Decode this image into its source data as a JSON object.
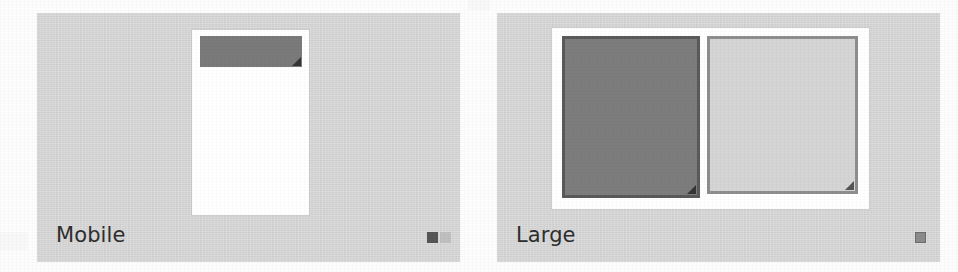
{
  "page": {
    "background_color": "#fdfdfd"
  },
  "colors": {
    "panel_background": "#d6d6d6",
    "card_background": "#ffffff",
    "block_dark": "#7a7a7a",
    "block_dark_border": "#5a5a5a",
    "block_light": "#d5d5d5",
    "block_light_border": "#8e8e8e",
    "label_text": "#2e2e2e",
    "badge_dark": "#565656",
    "badge_light": "#bfbfbf",
    "handle": "#2f2f2f"
  },
  "panels": [
    {
      "id": "mobile",
      "label": "Mobile",
      "badges": [
        {
          "name": "badge-active",
          "style": "dark"
        },
        {
          "name": "badge-inactive",
          "style": "light"
        }
      ],
      "card": {
        "name": "mobile-viewport-card",
        "blocks": [
          {
            "name": "header-band",
            "style": "filled-dark",
            "resizable": true
          }
        ]
      }
    },
    {
      "id": "large",
      "label": "Large",
      "badges": [
        {
          "name": "badge-active",
          "style": "outlined"
        }
      ],
      "card": {
        "name": "large-viewport-card",
        "blocks": [
          {
            "name": "primary-column",
            "style": "filled-dark bordered",
            "resizable": true
          },
          {
            "name": "secondary-column",
            "style": "filled-light",
            "resizable": true
          }
        ]
      }
    }
  ]
}
